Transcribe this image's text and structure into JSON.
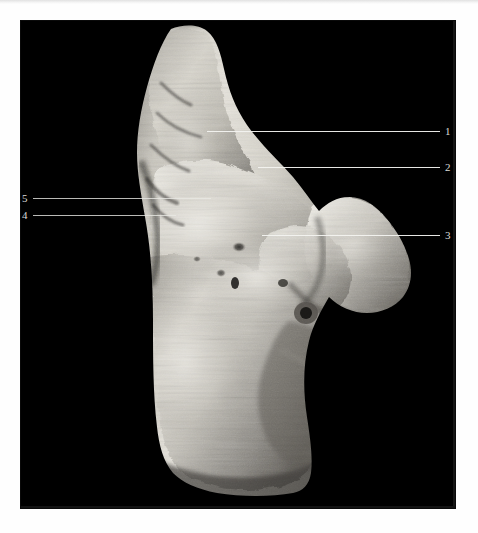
{
  "page": {
    "background_color": "#fefefe",
    "scan_artifact_top_text": "",
    "scan_artifact_bottom_text": ""
  },
  "photo": {
    "background_color": "#000000",
    "left": 21,
    "top": 21,
    "width": 434,
    "height": 487,
    "subject": "anatomical specimen",
    "caption": ""
  },
  "labels": [
    {
      "id": "label-1",
      "number": "1",
      "side": "right",
      "number_x": 445,
      "number_y": 126,
      "line_y": 131,
      "line_x_start": 207,
      "line_x_end": 440
    },
    {
      "id": "label-2",
      "number": "2",
      "side": "right",
      "number_x": 445,
      "number_y": 162,
      "line_y": 167,
      "line_x_start": 258,
      "line_x_end": 440
    },
    {
      "id": "label-3",
      "number": "3",
      "side": "right",
      "number_x": 445,
      "number_y": 230,
      "line_y": 235,
      "line_x_start": 262,
      "line_x_end": 440
    },
    {
      "id": "label-4",
      "number": "4",
      "side": "left",
      "number_x": 22,
      "number_y": 210,
      "line_y": 215,
      "line_x_start": 33,
      "line_x_end": 176
    },
    {
      "id": "label-5",
      "number": "5",
      "side": "left",
      "number_x": 22,
      "number_y": 193,
      "line_y": 198,
      "line_x_start": 33,
      "line_x_end": 211
    }
  ],
  "colors": {
    "photo_background": "#000000",
    "leader_line": "#f3f3f0",
    "number_text": "#dcdcd8",
    "page_background": "#fefefe",
    "specimen_highlight": "#eceae4",
    "specimen_midtone": "#b9b6ae",
    "specimen_shadow": "#6e6b65",
    "specimen_deep_shadow": "#2b2a28"
  }
}
